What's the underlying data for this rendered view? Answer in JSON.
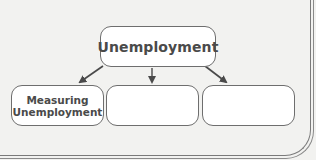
{
  "diagram": {
    "type": "tree",
    "root": {
      "label": "Unemployment"
    },
    "children": [
      {
        "label": "Measuring Unemployment",
        "line1": "Measuring",
        "line2": "Unemployment"
      },
      {
        "label": ""
      },
      {
        "label": ""
      }
    ],
    "colors": {
      "background": "#f2f2f0",
      "box_fill": "#ffffff",
      "box_border": "#6e6e6e",
      "text": "#4a4a4a",
      "arrow": "#4a4a4a"
    }
  }
}
